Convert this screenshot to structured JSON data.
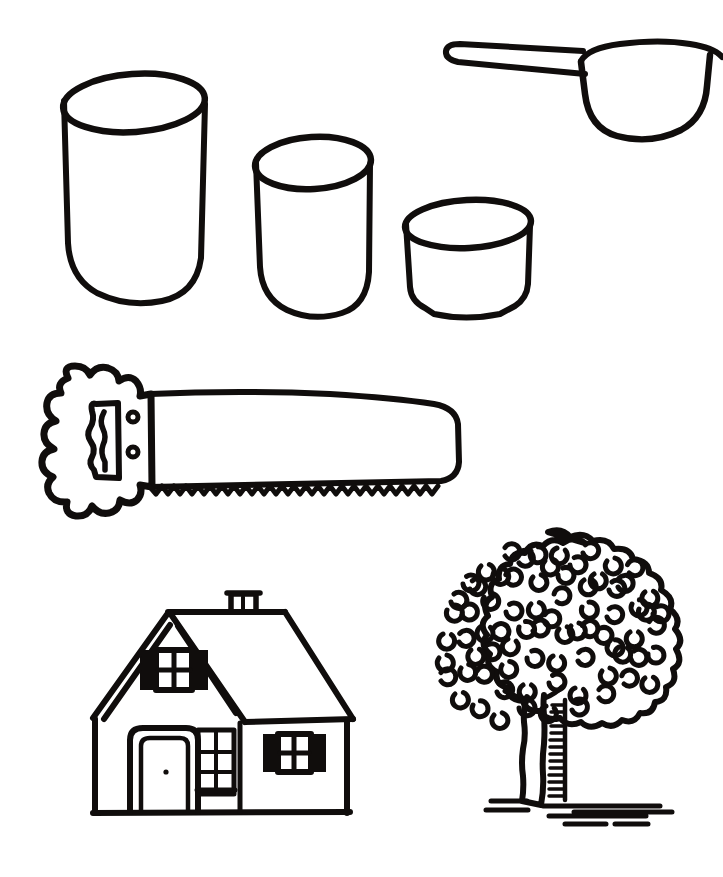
{
  "page": {
    "background_color": "#ffffff",
    "ink_color": "#100d0c",
    "width": 723,
    "height": 877,
    "style": "black-and-white hand-drawn coloring-book outline art",
    "object_count": 6
  },
  "objects": [
    {
      "id": "cylinder-large",
      "name": "Large measuring cup",
      "shape": "cylinder with elliptical open top and rounded bottom",
      "size_rank": "largest",
      "bounds": {
        "x": 62,
        "y": 75,
        "w": 143,
        "h": 228
      }
    },
    {
      "id": "cylinder-medium",
      "name": "Medium measuring cup",
      "shape": "cylinder with elliptical open top and rounded bottom",
      "size_rank": "medium",
      "bounds": {
        "x": 255,
        "y": 135,
        "w": 116,
        "h": 182
      }
    },
    {
      "id": "cylinder-small",
      "name": "Small measuring cup",
      "shape": "cylinder with elliptical open top and rounded bottom",
      "size_rank": "smallest",
      "bounds": {
        "x": 404,
        "y": 200,
        "w": 126,
        "h": 119
      }
    },
    {
      "id": "scoop",
      "name": "Measuring scoop",
      "shape": "rounded bowl with long flat handle extending to the left",
      "note": "bowl is cropped by the right edge of the page",
      "bounds": {
        "x": 445,
        "y": 38,
        "w": 278,
        "h": 100
      }
    },
    {
      "id": "saw",
      "name": "Hand saw",
      "shape": "scalloped handle with grip hole, two rivets, and a long blade with zigzag teeth",
      "parts": [
        "handle",
        "grip-hole",
        "rivet-upper",
        "rivet-lower",
        "blade",
        "teeth"
      ],
      "tooth_count": 30,
      "bounds": {
        "x": 38,
        "y": 365,
        "w": 423,
        "h": 160
      }
    },
    {
      "id": "house",
      "name": "House",
      "shape": "cottage with gable dormer, chimney, door and three shuttered windows",
      "parts": [
        "roof",
        "chimney",
        "dormer-gable",
        "front-wall",
        "door",
        "door-knob",
        "dormer-window",
        "narrow-window",
        "side-window"
      ],
      "window_count": 3,
      "bounds": {
        "x": 90,
        "y": 590,
        "w": 265,
        "h": 228
      }
    },
    {
      "id": "tree",
      "name": "Tree",
      "shape": "round bumpy canopy filled with C-shaped leaf marks above a shaded trunk on a ground line",
      "parts": [
        "canopy",
        "leaf-marks",
        "trunk",
        "trunk-shading",
        "ground-lines"
      ],
      "leaf_mark_count": 78,
      "bounds": {
        "x": 424,
        "y": 530,
        "w": 248,
        "h": 292
      }
    }
  ],
  "captions": {
    "cylinder_large": "Large measuring cup",
    "cylinder_medium": "Medium measuring cup",
    "cylinder_small": "Small measuring cup",
    "scoop": "Measuring scoop",
    "saw": "Hand saw",
    "house": "House",
    "tree": "Tree"
  }
}
